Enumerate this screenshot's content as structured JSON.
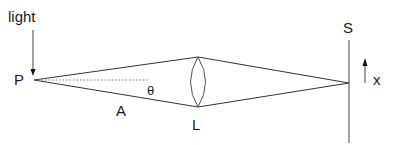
{
  "diagram": {
    "type": "optics-ray-diagram",
    "labels": {
      "light": "light",
      "point": "P",
      "angle": "θ",
      "segment": "A",
      "lens": "L",
      "screen": "S",
      "axis": "x"
    },
    "colors": {
      "line": "#333333",
      "lens": "#555555",
      "dotted": "#666666",
      "text": "#1a1a1a"
    }
  }
}
